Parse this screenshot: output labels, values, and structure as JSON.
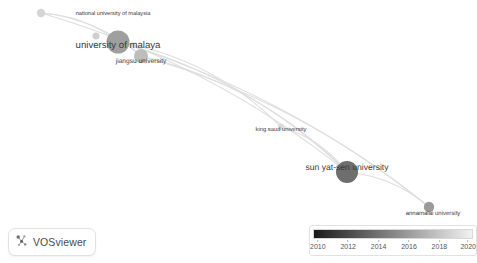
{
  "app": {
    "name": "VOSviewer",
    "logo_icon": "vosviewer-network-icon"
  },
  "canvas": {
    "width": 477,
    "height": 263,
    "background": "#ffffff"
  },
  "legend": {
    "title": "",
    "gradient_from": "#1a1a1a",
    "gradient_to": "#f2f2f2",
    "ticks": [
      {
        "label": "2010",
        "pos": 3
      },
      {
        "label": "2012",
        "pos": 22
      },
      {
        "label": "2014",
        "pos": 41
      },
      {
        "label": "2016",
        "pos": 60
      },
      {
        "label": "2018",
        "pos": 79
      },
      {
        "label": "2020",
        "pos": 97
      }
    ]
  },
  "chart_data": {
    "type": "scatter",
    "title": "",
    "xlabel": "",
    "ylabel": "",
    "colormap": "avg. publication year (2010 dark → 2020 light)",
    "nodes": [
      {
        "id": "national-university-of-malaysia",
        "label": "national university of malaysia",
        "x": 41,
        "y": 13,
        "r": 4.2,
        "color": "#d5d5d5",
        "label_x": 113,
        "label_y": 14,
        "label_size": 5.6
      },
      {
        "id": "small-node-upper",
        "label": "",
        "x": 96,
        "y": 36,
        "r": 3.6,
        "color": "#d0d0d0",
        "label_x": 0,
        "label_y": 0,
        "label_size": 0
      },
      {
        "id": "university-of-malaya",
        "label": "university of malaya",
        "x": 118,
        "y": 42,
        "r": 11.5,
        "color": "#9f9f9f",
        "label_x": 118,
        "label_y": 45,
        "label_size": 9.6
      },
      {
        "id": "jiangsu-university",
        "label": "jiangsu university",
        "x": 141,
        "y": 56,
        "r": 7.0,
        "color": "#bdbdbd",
        "label_x": 141,
        "label_y": 61,
        "label_size": 6.6
      },
      {
        "id": "king-saud-university",
        "label": "king saud university",
        "x": 281,
        "y": 127,
        "r": 3.2,
        "color": "#dcdcdc",
        "label_x": 281,
        "label_y": 130,
        "label_size": 5.8
      },
      {
        "id": "sun-yat-sen-university",
        "label": "sun yat-sen university",
        "x": 347,
        "y": 172,
        "r": 11.0,
        "color": "#6e6e6e",
        "label_x": 347,
        "label_y": 167,
        "label_size": 8.6
      },
      {
        "id": "annamalai-university",
        "label": "annamalai university",
        "x": 429,
        "y": 207,
        "r": 5.2,
        "color": "#9a9a9a",
        "label_x": 433,
        "label_y": 214,
        "label_size": 6.0
      }
    ],
    "edges": [
      {
        "from": "national-university-of-malaysia",
        "to": "university-of-malaya"
      },
      {
        "from": "national-university-of-malaysia",
        "to": "jiangsu-university"
      },
      {
        "from": "national-university-of-malaysia",
        "to": "sun-yat-sen-university"
      },
      {
        "from": "university-of-malaya",
        "to": "jiangsu-university"
      },
      {
        "from": "university-of-malaya",
        "to": "king-saud-university"
      },
      {
        "from": "university-of-malaya",
        "to": "sun-yat-sen-university"
      },
      {
        "from": "university-of-malaya",
        "to": "annamalai-university"
      },
      {
        "from": "jiangsu-university",
        "to": "sun-yat-sen-university"
      },
      {
        "from": "jiangsu-university",
        "to": "annamalai-university"
      },
      {
        "from": "king-saud-university",
        "to": "sun-yat-sen-university"
      },
      {
        "from": "sun-yat-sen-university",
        "to": "annamalai-university"
      }
    ],
    "legend_position": "bottom-right",
    "grid": false
  }
}
